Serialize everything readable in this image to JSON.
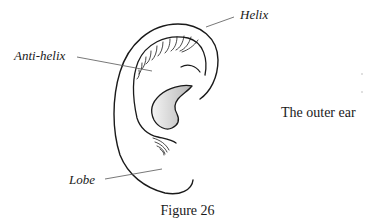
{
  "figure": {
    "caption": "Figure 26",
    "title": "The outer ear",
    "labels": {
      "helix": "Helix",
      "anti_helix": "Anti-helix",
      "lobe": "Lobe"
    },
    "colors": {
      "stroke": "#1a1a1a",
      "leader_line": "#555555",
      "concha_fill_light": "#f2f2f2",
      "concha_fill_dark": "#b8b8b8"
    }
  }
}
